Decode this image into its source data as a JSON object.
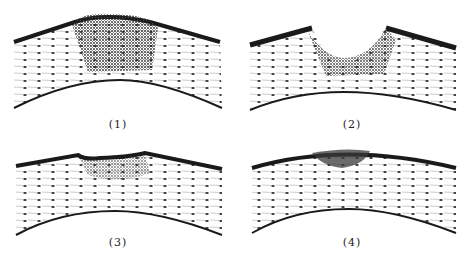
{
  "figure": {
    "panels": [
      {
        "id": 1,
        "label": "(1)",
        "stage": "raised-dense-infiltrate"
      },
      {
        "id": 2,
        "label": "(2)",
        "stage": "ulcerated-crater"
      },
      {
        "id": 3,
        "label": "(3)",
        "stage": "shallow-healing-depression"
      },
      {
        "id": 4,
        "label": "(4)",
        "stage": "scar-flat-surface"
      }
    ]
  },
  "colors": {
    "epithelium": "#1a1a1a",
    "stroma_fiber": "#9a9a9a",
    "nuclei": "#333333",
    "infiltrate": "#2a2a2a",
    "background": "#ffffff"
  }
}
